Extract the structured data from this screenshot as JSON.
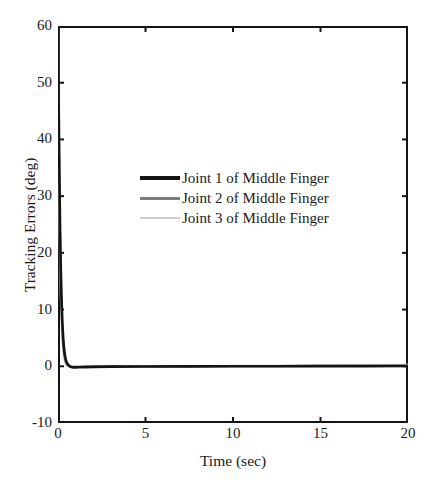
{
  "chart_data": {
    "type": "line",
    "title": "",
    "xlabel": "Time (sec)",
    "ylabel": "Tracking Errors (deg)",
    "xlim": [
      0,
      20
    ],
    "ylim": [
      -10,
      60
    ],
    "xticks": [
      0,
      5,
      10,
      15,
      20
    ],
    "yticks": [
      -10,
      0,
      10,
      20,
      30,
      40,
      50,
      60
    ],
    "xtick_labels": [
      "0",
      "5",
      "10",
      "15",
      "20"
    ],
    "ytick_labels": [
      "-10",
      "0",
      "10",
      "20",
      "30",
      "40",
      "50",
      "60"
    ],
    "grid": false,
    "legend_position": "upper-center",
    "series": [
      {
        "name": "Joint 1 of Middle Finger",
        "color": "#141414",
        "linewidth": 2.6,
        "x": [
          0,
          0.04,
          0.08,
          0.12,
          0.16,
          0.2,
          0.25,
          0.3,
          0.35,
          0.4,
          0.45,
          0.5,
          0.6,
          0.7,
          0.8,
          0.9,
          1.0,
          1.2,
          1.5,
          2.0,
          3.0,
          5.0,
          7.5,
          10.0,
          12.5,
          15.0,
          17.5,
          20.0
        ],
        "y": [
          60,
          46,
          33.5,
          24,
          17,
          12,
          7.6,
          4.8,
          3.0,
          1.85,
          1.1,
          0.65,
          0.2,
          -0.05,
          -0.15,
          -0.2,
          -0.2,
          -0.18,
          -0.14,
          -0.1,
          -0.06,
          -0.03,
          -0.01,
          0.0,
          0.01,
          0.02,
          0.03,
          0.05
        ]
      },
      {
        "name": "Joint 2 of Middle Finger",
        "color": "#7d7d7d",
        "linewidth": 2.2,
        "x": [
          0,
          0.04,
          0.08,
          0.12,
          0.16,
          0.2,
          0.25,
          0.3,
          0.35,
          0.4,
          0.45,
          0.5,
          0.6,
          0.7,
          0.8,
          0.9,
          1.0,
          1.2,
          1.5,
          2.0,
          3.0,
          5.0,
          7.5,
          10.0,
          12.5,
          15.0,
          17.5,
          20.0
        ],
        "y": [
          60,
          44,
          31,
          21.5,
          15,
          10.4,
          6.3,
          3.8,
          2.25,
          1.3,
          0.72,
          0.38,
          0.08,
          -0.04,
          -0.08,
          -0.1,
          -0.1,
          -0.09,
          -0.07,
          -0.05,
          -0.03,
          -0.01,
          0.0,
          0.02,
          0.04,
          0.06,
          0.09,
          0.12
        ]
      },
      {
        "name": "Joint 3 of Middle Finger",
        "color": "#cfcfcf",
        "linewidth": 2.2,
        "x": [
          0,
          0.04,
          0.08,
          0.12,
          0.16,
          0.2,
          0.25,
          0.3,
          0.35,
          0.4,
          0.45,
          0.5,
          0.6,
          0.7,
          0.8,
          0.9,
          1.0,
          1.2,
          1.5,
          2.0,
          3.0,
          5.0,
          7.5,
          10.0,
          12.5,
          15.0,
          17.5,
          20.0
        ],
        "y": [
          60,
          42,
          28.5,
          19,
          12.7,
          8.4,
          4.8,
          2.7,
          1.5,
          0.8,
          0.4,
          0.18,
          0.0,
          -0.05,
          -0.07,
          -0.07,
          -0.06,
          -0.05,
          -0.04,
          -0.03,
          -0.01,
          0.01,
          0.03,
          0.06,
          0.09,
          0.13,
          0.18,
          0.24
        ]
      }
    ],
    "annotations": []
  },
  "legend": {
    "entries": [
      {
        "label": "Joint 1 of Middle Finger",
        "color": "#141414",
        "linewidth": 4.0
      },
      {
        "label": "Joint 2 of Middle Finger",
        "color": "#7d7d7d",
        "linewidth": 3.0
      },
      {
        "label": "Joint 3 of Middle Finger",
        "color": "#cfcfcf",
        "linewidth": 2.4
      }
    ]
  },
  "axes": {
    "x_title": "Time (sec)",
    "y_title": "Tracking Errors (deg)"
  },
  "colors": {
    "frame": "#141414",
    "background": "#ffffff",
    "text": "#1a1a1a"
  }
}
